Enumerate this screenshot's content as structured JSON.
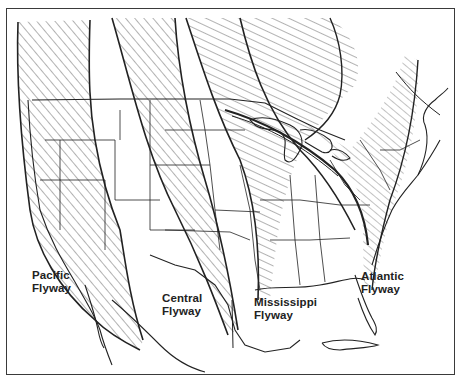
{
  "map": {
    "subject": "North American bird migration flyways",
    "colors": {
      "ink": "#222222",
      "hatch": "#555555",
      "background": "#ffffff",
      "border": "#3a3a3a"
    },
    "flyways": [
      {
        "id": "pacific",
        "line1": "Pacific",
        "line2": "Flyway"
      },
      {
        "id": "central",
        "line1": "Central",
        "line2": "Flyway"
      },
      {
        "id": "mississippi",
        "line1": "Mississippi",
        "line2": "Flyway"
      },
      {
        "id": "atlantic",
        "line1": "Atlantic",
        "line2": "Flyway"
      }
    ]
  }
}
